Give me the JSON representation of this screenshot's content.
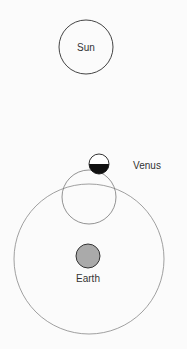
{
  "diagram": {
    "sun": {
      "label": "Sun"
    },
    "venus": {
      "label": "Venus",
      "phase": "half-lit (bottom half dark)"
    },
    "earth": {
      "label": "Earth"
    }
  },
  "colors": {
    "outline": "#444444",
    "orbit": "#888888",
    "earth_fill": "#aaaaaa",
    "venus_dark": "#111111",
    "background": "#fbfbfb"
  }
}
